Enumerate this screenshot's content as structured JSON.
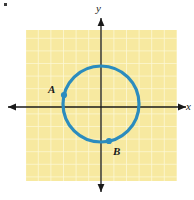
{
  "figure": {
    "background_color": "#ffffff",
    "corner_mark": {
      "name": "corner-mark",
      "color": "#3a3a3a"
    },
    "grid": {
      "fill_color": "#f7e9a0",
      "line_color": "#fdf8d6",
      "x": 26,
      "y": 30,
      "width": 151,
      "height": 151,
      "cell_size": 12.6,
      "columns": 12,
      "rows": 12
    },
    "axes": {
      "color": "#1a1a1a",
      "x_axis": {
        "label": "x",
        "y_position": 107,
        "x_start": 6,
        "x_end": 188
      },
      "y_axis": {
        "label": "y",
        "x_position": 101,
        "y_start": 16,
        "y_end": 194
      },
      "origin": {
        "x": 101,
        "y": 107
      }
    },
    "circle": {
      "center_x": 101,
      "center_y": 104,
      "radius": 38,
      "stroke_color": "#2b8cbe",
      "stroke_width": 3.2
    },
    "points": [
      {
        "label": "A",
        "x": 64,
        "y": 95,
        "color": "#2b8cbe",
        "radius": 3.1
      },
      {
        "label": "B",
        "x": 109,
        "y": 141,
        "color": "#2b8cbe",
        "radius": 3.1
      }
    ]
  }
}
